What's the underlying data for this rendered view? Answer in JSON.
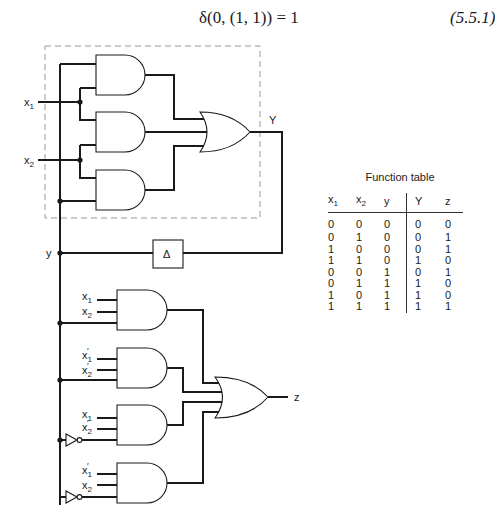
{
  "equation": {
    "expression": "δ(0, (1, 1)) = 1",
    "number": "(5.5.1)"
  },
  "circuit": {
    "labels": {
      "x1": "x",
      "x2": "x",
      "sub1": "1",
      "sub2": "2",
      "Y": "Y",
      "y": "y",
      "z": "z",
      "delay": "Δ",
      "prime": "′"
    },
    "upper_section": {
      "description": "Next-state logic (dashed box): three AND gates feeding OR gate producing Y",
      "and_gates": [
        {
          "inputs": [
            "y",
            "x1"
          ]
        },
        {
          "inputs": [
            "x1",
            "x2"
          ]
        },
        {
          "inputs": [
            "x2",
            "y"
          ]
        }
      ],
      "or_gate": {
        "output": "Y"
      }
    },
    "delay_element": {
      "symbol": "Δ",
      "input": "Y",
      "output": "y"
    },
    "lower_section": {
      "description": "Output logic: four 3-input AND gates feeding OR gate producing z",
      "and_gates": [
        {
          "inputs": [
            "x1",
            "x2",
            "y"
          ]
        },
        {
          "inputs": [
            "x1′",
            "x2′",
            "y"
          ]
        },
        {
          "inputs": [
            "x1",
            "x2′",
            "y′"
          ]
        },
        {
          "inputs": [
            "x1′",
            "x2",
            "y′"
          ]
        }
      ],
      "or_gate": {
        "output": "z"
      }
    }
  },
  "function_table": {
    "title": "Function table",
    "headers": [
      {
        "base": "x",
        "sub": "1"
      },
      {
        "base": "x",
        "sub": "2"
      },
      {
        "base": "y",
        "sub": ""
      },
      {
        "base": "Y",
        "sub": ""
      },
      {
        "base": "z",
        "sub": ""
      }
    ],
    "rows": [
      [
        "0",
        "0",
        "0",
        "0",
        "0"
      ],
      [
        "0",
        "1",
        "0",
        "0",
        "1"
      ],
      [
        "1",
        "0",
        "0",
        "0",
        "1"
      ],
      [
        "1",
        "1",
        "0",
        "1",
        "0"
      ],
      [
        "0",
        "0",
        "1",
        "0",
        "1"
      ],
      [
        "0",
        "1",
        "1",
        "1",
        "0"
      ],
      [
        "1",
        "0",
        "1",
        "1",
        "0"
      ],
      [
        "1",
        "1",
        "1",
        "1",
        "1"
      ]
    ]
  }
}
